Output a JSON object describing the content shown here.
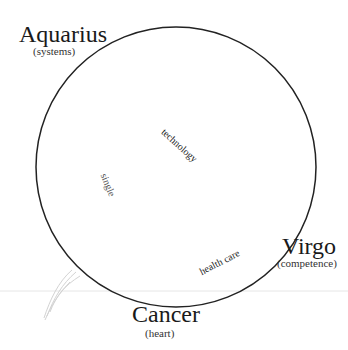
{
  "diagram": {
    "type": "zodiac-circle",
    "circle": {
      "cx": 176,
      "cy": 167,
      "r": 140,
      "stroke": "#222222"
    },
    "signs": [
      {
        "name": "Aquarius",
        "keyword": "(systems)"
      },
      {
        "name": "Virgo",
        "keyword": "(competence)"
      },
      {
        "name": "Cancer",
        "keyword": "(heart)"
      }
    ],
    "inner_labels": [
      {
        "text": "technology"
      },
      {
        "text": "single"
      },
      {
        "text": "health care"
      }
    ]
  }
}
